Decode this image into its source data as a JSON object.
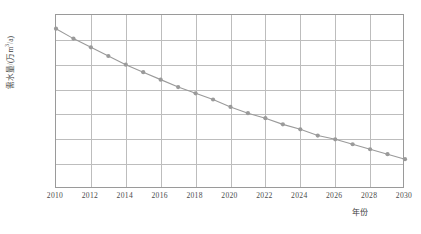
{
  "chart_data": {
    "type": "line",
    "title": "",
    "subtitle": "",
    "xlabel": "年份",
    "ylabel": "需水量/(万m³/a)",
    "ylabel_main": "需水量/(万m",
    "ylabel_sup": "3",
    "ylabel_tail": "/a)",
    "xlim": [
      2010,
      2030
    ],
    "ylim": [
      25,
      26.4
    ],
    "grid": true,
    "legend": null,
    "marker": "circle",
    "line_color": "#9a9a9a",
    "marker_color": "#8f8f8f",
    "grid_color": "#bdbdbd",
    "axis_color": "#9a9a9a",
    "x": [
      2010,
      2011,
      2012,
      2013,
      2014,
      2015,
      2016,
      2017,
      2018,
      2019,
      2020,
      2021,
      2022,
      2023,
      2024,
      2025,
      2026,
      2027,
      2028,
      2029,
      2030
    ],
    "values": [
      26.29,
      26.21,
      26.14,
      26.07,
      26.0,
      25.94,
      25.88,
      25.82,
      25.77,
      25.72,
      25.66,
      25.61,
      25.57,
      25.52,
      25.48,
      25.43,
      25.4,
      25.36,
      25.32,
      25.28,
      25.24
    ],
    "series": [
      {
        "name": "需水量",
        "values": [
          26.29,
          26.21,
          26.14,
          26.07,
          26.0,
          25.94,
          25.88,
          25.82,
          25.77,
          25.72,
          25.66,
          25.61,
          25.57,
          25.52,
          25.48,
          25.43,
          25.4,
          25.36,
          25.32,
          25.28,
          25.24
        ]
      }
    ],
    "yticks": [
      25,
      25.2,
      25.4,
      25.6,
      25.8,
      26,
      26.2,
      26.4
    ],
    "ytick_labels": [
      "25",
      "25.2",
      "25.4",
      "25.6",
      "25.8",
      "26",
      "26.2",
      "26.4"
    ],
    "xticks": [
      2010,
      2012,
      2014,
      2016,
      2018,
      2020,
      2022,
      2024,
      2026,
      2028,
      2030
    ],
    "xtick_labels": [
      "2010",
      "2012",
      "2014",
      "2016",
      "2018",
      "2020",
      "2022",
      "2024",
      "2026",
      "2028",
      "2030"
    ]
  }
}
